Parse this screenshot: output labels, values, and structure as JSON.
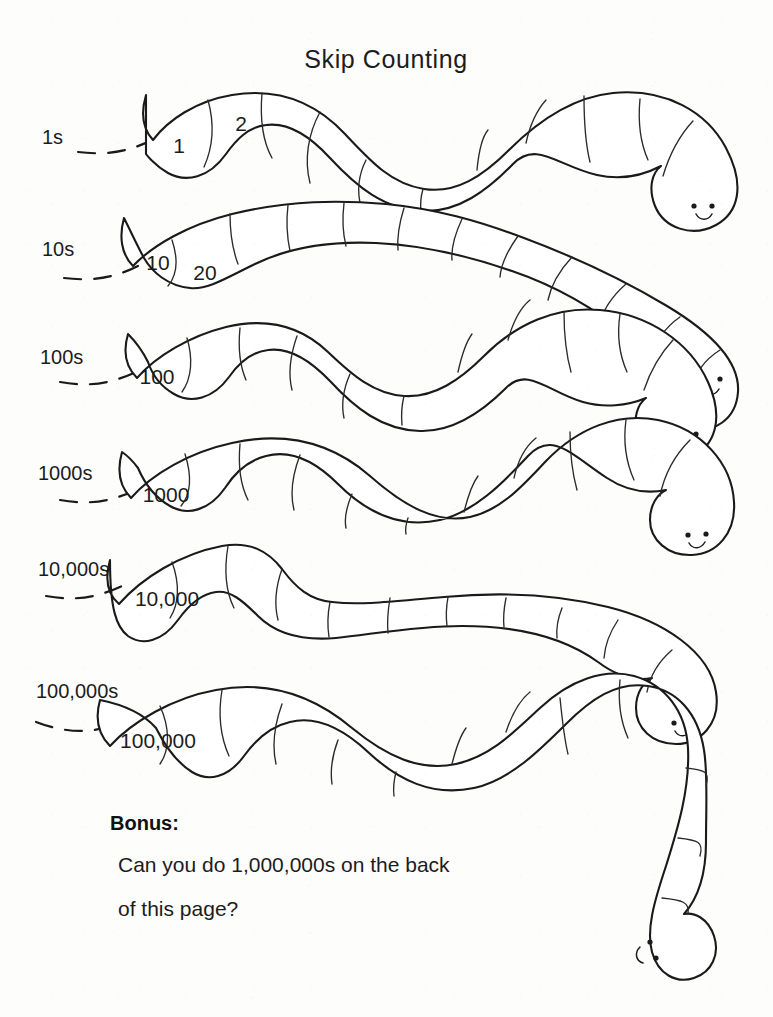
{
  "page": {
    "title": "Skip Counting",
    "background_color": "#fdfdfc",
    "ink_color": "#1a1a1a",
    "width": 773,
    "height": 1017
  },
  "worksheet": {
    "type": "skip-counting-worm-worksheet",
    "instruction_implied": "Fill in the remaining worm segments by skip counting",
    "rows": [
      {
        "id": "row-1s",
        "label": "1s",
        "step": 1,
        "filled_segments": [
          "1",
          "2"
        ],
        "blank_segment_count": 9,
        "worm_has_face": true
      },
      {
        "id": "row-10s",
        "label": "10s",
        "step": 10,
        "filled_segments": [
          "10",
          "20"
        ],
        "blank_segment_count": 9,
        "worm_has_face": true
      },
      {
        "id": "row-100s",
        "label": "100s",
        "step": 100,
        "filled_segments": [
          "100"
        ],
        "blank_segment_count": 9,
        "worm_has_face": true
      },
      {
        "id": "row-1000s",
        "label": "1000s",
        "step": 1000,
        "filled_segments": [
          "1000"
        ],
        "blank_segment_count": 9,
        "worm_has_face": true
      },
      {
        "id": "row-10000s",
        "label": "10,000s",
        "step": 10000,
        "filled_segments": [
          "10,000"
        ],
        "blank_segment_count": 9,
        "worm_has_face": true
      },
      {
        "id": "row-100000s",
        "label": "100,000s",
        "step": 100000,
        "filled_segments": [
          "100,000"
        ],
        "blank_segment_count": 10,
        "worm_has_face": true
      }
    ]
  },
  "bonus": {
    "heading": "Bonus:",
    "line1": "Can you do 1,000,000s on the back",
    "line2": "of this page?"
  }
}
